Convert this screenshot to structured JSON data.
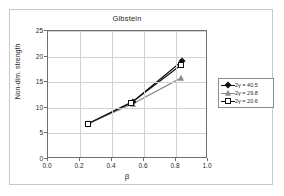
{
  "figure": {
    "title": "Gibstein",
    "background": "#ffffff",
    "frame_color": "#c8c8c8"
  },
  "axes": {
    "x": {
      "title": "β",
      "ticks": [
        "0.0",
        "0.2",
        "0.4",
        "0.6",
        "0.8",
        "1.0"
      ],
      "min": 0.0,
      "max": 1.0
    },
    "y": {
      "title": "Non-dim. strength",
      "ticks": [
        "0",
        "5",
        "10",
        "15",
        "20",
        "25"
      ],
      "min": 0,
      "max": 25
    }
  },
  "legend": {
    "entries": [
      {
        "label": "2γ = 40.5",
        "marker": "filled-diamond",
        "color": "#111111"
      },
      {
        "label": "2γ = 29.8",
        "marker": "filled-triangle",
        "color": "#8a8a8a"
      },
      {
        "label": "2γ = 20.6",
        "marker": "open-square",
        "color": "#111111"
      }
    ]
  },
  "chart_data": {
    "type": "line",
    "title": "Gibstein",
    "xlabel": "β",
    "ylabel": "Non-dim. strength",
    "xlim": [
      0.0,
      1.0
    ],
    "ylim": [
      0,
      25
    ],
    "grid": true,
    "legend_position": "right",
    "series": [
      {
        "name": "2γ = 40.5",
        "marker": "filled-diamond",
        "color": "#111111",
        "x": [
          0.25,
          0.53,
          0.84
        ],
        "y": [
          6.9,
          11.2,
          19.2
        ]
      },
      {
        "name": "2γ = 29.8",
        "marker": "filled-triangle",
        "color": "#8a8a8a",
        "x": [
          0.25,
          0.53,
          0.83
        ],
        "y": [
          6.9,
          10.8,
          15.8
        ]
      },
      {
        "name": "2γ = 20.6",
        "marker": "open-square",
        "color": "#111111",
        "x": [
          0.25,
          0.52,
          0.83
        ],
        "y": [
          6.9,
          11.0,
          18.3
        ]
      }
    ]
  }
}
